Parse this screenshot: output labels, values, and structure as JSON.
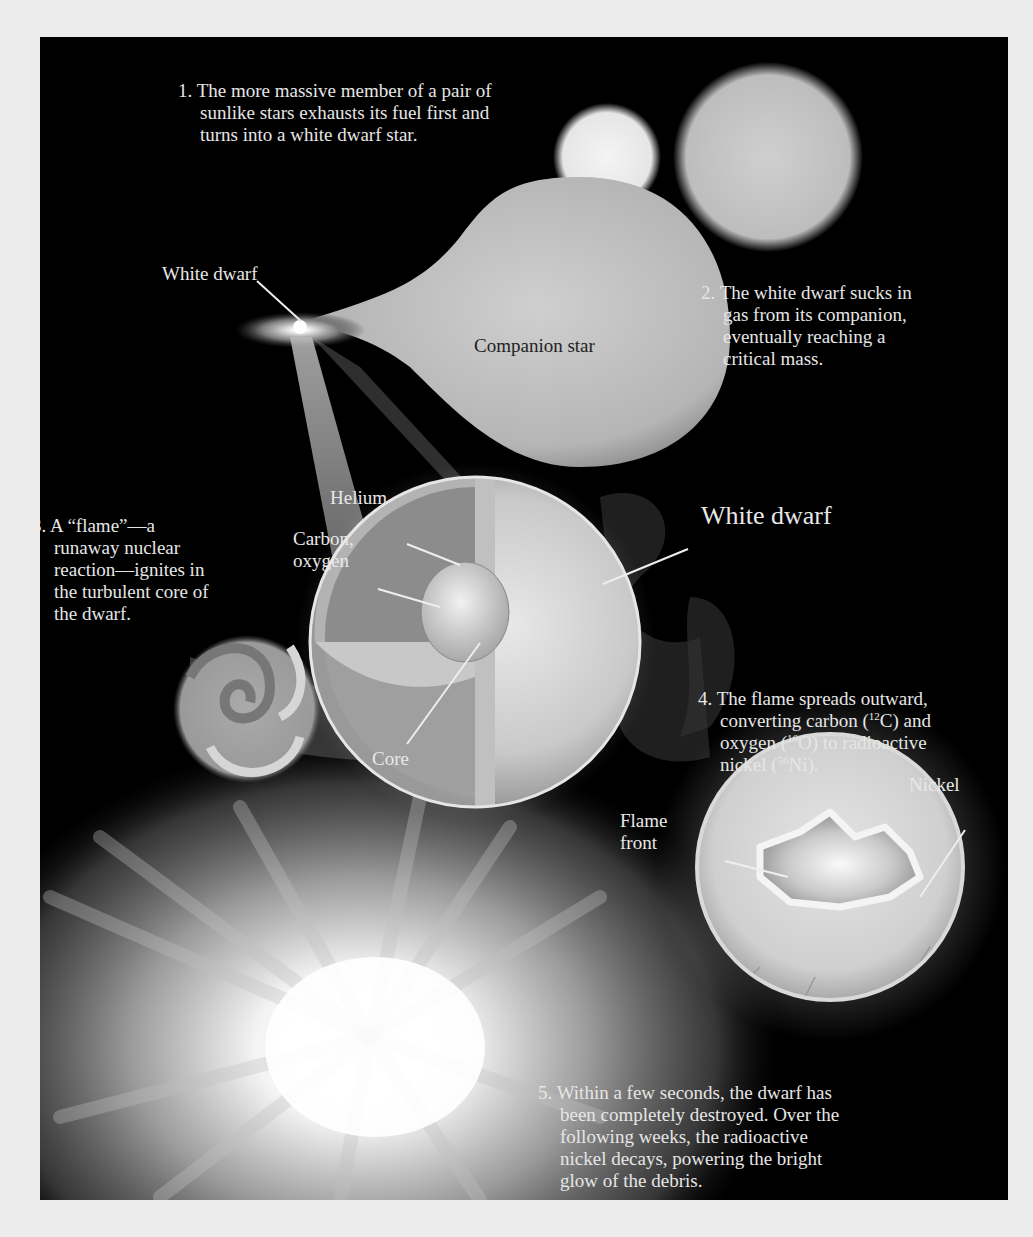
{
  "diagram": {
    "colors": {
      "background": "#000000",
      "page": "#ececec",
      "text": "#e6e6e6",
      "star_light": "#d8d8d8"
    },
    "steps": [
      {
        "number": "1.",
        "lines": [
          "The more massive member of a pair of",
          "sunlike stars exhausts its fuel first and",
          "turns into a white dwarf star."
        ]
      },
      {
        "number": "2.",
        "lines": [
          "The white dwarf sucks in",
          "gas from its companion,",
          "eventually reaching a",
          "critical mass."
        ]
      },
      {
        "number": "3.",
        "lines": [
          "A “flame”—a",
          "runaway nuclear",
          "reaction—ignites in",
          "the turbulent core of",
          "the dwarf."
        ]
      },
      {
        "number": "4.",
        "line1": "The flame spreads outward,",
        "line2_pre": "converting carbon (",
        "line2_sup": "12",
        "line2_post": "C) and",
        "line3_pre": "oxygen (",
        "line3_sup": "16",
        "line3_post": "O) to radioactive",
        "line4_pre": "nickel (",
        "line4_sup": "56",
        "line4_post": "Ni)."
      },
      {
        "number": "5.",
        "lines": [
          "Within a few seconds, the dwarf has",
          "been completely destroyed. Over the",
          "following weeks, the radioactive",
          "nickel decays, powering the bright",
          "glow of the debris."
        ]
      }
    ],
    "labels": {
      "white_dwarf_small": "White dwarf",
      "companion_star": "Companion star",
      "helium": "Helium",
      "carbon_oxygen_1": "Carbon,",
      "carbon_oxygen_2": "oxygen",
      "core": "Core",
      "white_dwarf_large": "White dwarf",
      "flame_front_1": "Flame",
      "flame_front_2": "front",
      "nickel": "Nickel"
    }
  }
}
